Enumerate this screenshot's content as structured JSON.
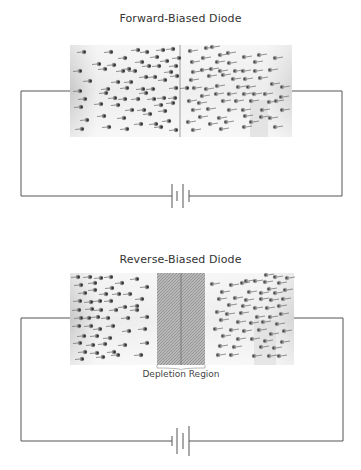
{
  "diagrams": [
    {
      "id": "forward",
      "title": "Forward-Biased Diode",
      "has_depletion_region": false
    },
    {
      "id": "reverse",
      "title": "Reverse-Biased Diode",
      "has_depletion_region": true,
      "depletion_label": "Depletion Region"
    }
  ],
  "colors": {
    "wire": "#555555",
    "block_light": "#f4f4f4",
    "block_dark": "#cfcfcf",
    "particle": "#444444",
    "hatch": "#9a9a9a"
  }
}
